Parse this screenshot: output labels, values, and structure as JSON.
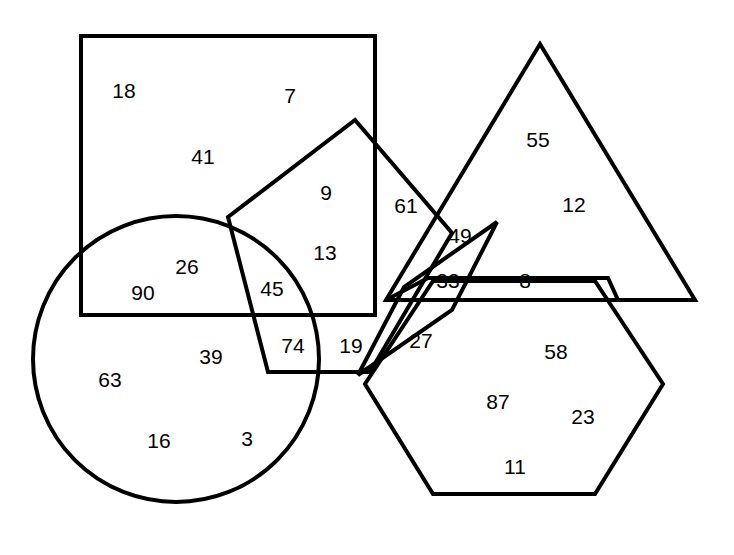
{
  "figure": {
    "width": 734,
    "height": 555,
    "background_color": "#ffffff",
    "stroke_color": "#000000",
    "stroke_width": 4,
    "label_color": "#000000",
    "label_font_size": 21
  },
  "shapes": [
    {
      "id": "square",
      "name": "square",
      "type": "rect",
      "x": 81,
      "y": 36,
      "width": 294,
      "height": 279
    },
    {
      "id": "circle",
      "name": "circle",
      "type": "circle",
      "cx": 176,
      "cy": 359,
      "r": 143
    },
    {
      "id": "pentagon",
      "name": "pentagon",
      "type": "polygon",
      "points": "228,217 355,120 452,233 370,372 268,372"
    },
    {
      "id": "triangle",
      "name": "triangle",
      "type": "polygon",
      "points": "540,44 695,300 386,300"
    },
    {
      "id": "parallelogram-wide",
      "name": "wide-parallelogram",
      "type": "polygon",
      "points": "428,278 608,278 618,300 386,300"
    },
    {
      "id": "parallelogram-slanted",
      "name": "slanted-parallelogram",
      "type": "polygon",
      "points": "497,222 452,310 358,375 404,287"
    },
    {
      "id": "hexagon",
      "name": "hexagon",
      "type": "polygon",
      "points": "433,281 595,281 663,384 595,494 433,494 365,384"
    }
  ],
  "labels": [
    {
      "text": "18",
      "x": 124,
      "y": 90
    },
    {
      "text": "7",
      "x": 290,
      "y": 95
    },
    {
      "text": "41",
      "x": 203,
      "y": 156
    },
    {
      "text": "9",
      "x": 326,
      "y": 192
    },
    {
      "text": "13",
      "x": 325,
      "y": 252
    },
    {
      "text": "26",
      "x": 187,
      "y": 266
    },
    {
      "text": "90",
      "x": 143,
      "y": 292
    },
    {
      "text": "45",
      "x": 272,
      "y": 288
    },
    {
      "text": "39",
      "x": 211,
      "y": 356
    },
    {
      "text": "74",
      "x": 293,
      "y": 345
    },
    {
      "text": "19",
      "x": 351,
      "y": 345
    },
    {
      "text": "63",
      "x": 110,
      "y": 379
    },
    {
      "text": "16",
      "x": 159,
      "y": 440
    },
    {
      "text": "3",
      "x": 247,
      "y": 438
    },
    {
      "text": "61",
      "x": 406,
      "y": 205
    },
    {
      "text": "55",
      "x": 538,
      "y": 139
    },
    {
      "text": "12",
      "x": 574,
      "y": 204
    },
    {
      "text": "49",
      "x": 460,
      "y": 235
    },
    {
      "text": "33",
      "x": 448,
      "y": 280
    },
    {
      "text": "8",
      "x": 525,
      "y": 280
    },
    {
      "text": "27",
      "x": 421,
      "y": 340
    },
    {
      "text": "58",
      "x": 556,
      "y": 351
    },
    {
      "text": "87",
      "x": 498,
      "y": 401
    },
    {
      "text": "23",
      "x": 583,
      "y": 416
    },
    {
      "text": "11",
      "x": 515,
      "y": 466
    }
  ]
}
